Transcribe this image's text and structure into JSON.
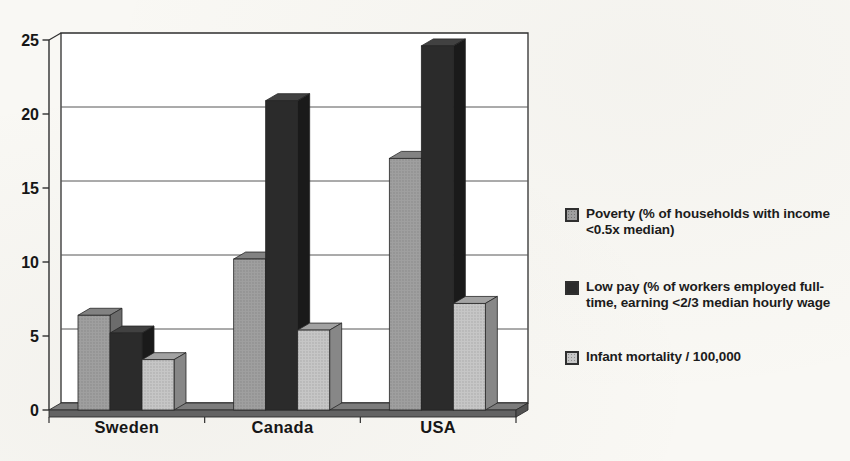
{
  "page": {
    "background_color": "#f9f8f4"
  },
  "chart_data": {
    "type": "bar",
    "variant": "3d-column",
    "title": "",
    "categories": [
      "Sweden",
      "Canada",
      "USA"
    ],
    "series": [
      {
        "name": "Poverty (% of households with income <0.5x median)",
        "color": "#9f9f9f",
        "values": [
          6.4,
          10.2,
          17.0
        ]
      },
      {
        "name": "Low pay (% of workers employed full-time, earning <2/3 median hourly wage",
        "color": "#2b2b2b",
        "values": [
          5.2,
          20.9,
          24.6
        ]
      },
      {
        "name": "Infant mortality / 100,000",
        "color": "#c6c6c6",
        "values": [
          3.4,
          5.4,
          7.2
        ]
      }
    ],
    "xlabel": "",
    "ylabel": "",
    "ylim": [
      0,
      25
    ],
    "y_ticks": [
      0,
      5,
      10,
      15,
      20,
      25
    ],
    "grid": true,
    "legend_position": "right",
    "wall_color": "#ffffff",
    "floor_color": "#7c7c7c",
    "line_color": "#2e2e2e"
  }
}
